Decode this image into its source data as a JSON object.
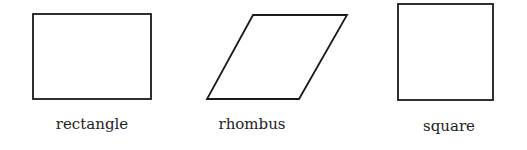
{
  "diagram": {
    "stroke_color": "#1a1a1a",
    "shapes": [
      {
        "name": "rectangle",
        "label": "rectangle"
      },
      {
        "name": "rhombus",
        "label": "rhombus"
      },
      {
        "name": "square",
        "label": "square"
      }
    ]
  }
}
